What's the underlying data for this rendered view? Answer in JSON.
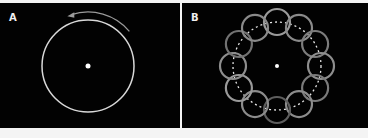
{
  "panels": [
    {
      "label": "A",
      "description": "Single circle rotating counter-clockwise around a central point",
      "circle": {
        "cx": 88,
        "cy": 63,
        "r": 46,
        "stroke": "#d8d8d8"
      },
      "center_dot": {
        "cx": 88,
        "cy": 63,
        "r": 2.5,
        "fill": "#ffffff"
      },
      "rotation_arrow": {
        "direction": "counter-clockwise",
        "stroke": "#9a9a9a"
      }
    },
    {
      "label": "B",
      "description": "Twelve small circles arranged evenly on a dashed circular path around a central point",
      "path_circle": {
        "cx": 95,
        "cy": 63,
        "r": 44,
        "stroke": "#e6e6e6",
        "dash": "2,3"
      },
      "center_dot": {
        "cx": 95,
        "cy": 63,
        "r": 2,
        "fill": "#ffffff"
      },
      "small_circle_radius": 13,
      "small_circle_count": 12,
      "small_circle_colors": [
        "#9a9a9a",
        "#8a8a8a",
        "#7c7c7c",
        "#8e8e8e",
        "#7a7a7a",
        "#8c8c8c",
        "#5e5e5e",
        "#8c8c8c",
        "#9a9a9a",
        "#8e8e8e",
        "#727272",
        "#8a8a8a"
      ]
    }
  ],
  "colors": {
    "background": "#020202",
    "border": "#f4f4f4"
  }
}
